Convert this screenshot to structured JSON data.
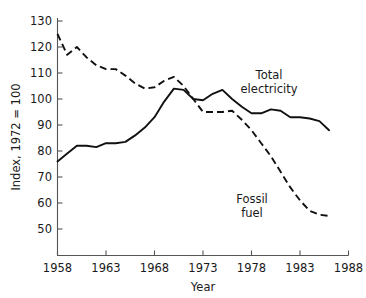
{
  "chart_data": {
    "type": "line",
    "title": "",
    "xlabel": "Year",
    "ylabel": "Index, 1972 = 100",
    "xlim": [
      1958,
      1988
    ],
    "ylim": [
      45,
      130
    ],
    "xticks": [
      "1958",
      "1963",
      "1968",
      "1973",
      "1978",
      "1983",
      "1988"
    ],
    "yticks": [
      "50",
      "60",
      "70",
      "80",
      "90",
      "100",
      "110",
      "120",
      "130"
    ],
    "grid": false,
    "legend_position": "inline-annotations",
    "series": [
      {
        "name": "Total electricity",
        "style": "solid",
        "label_text_line1": "Total",
        "label_text_line2": "electricity",
        "x": [
          1958,
          1959,
          1960,
          1961,
          1962,
          1963,
          1964,
          1965,
          1966,
          1967,
          1968,
          1969,
          1970,
          1971,
          1972,
          1973,
          1974,
          1975,
          1976,
          1977,
          1978,
          1979,
          1980,
          1981,
          1982,
          1983,
          1984,
          1985,
          1986
        ],
        "values": [
          76,
          79,
          82,
          82,
          81.5,
          83,
          83,
          83.5,
          86,
          89,
          93,
          99,
          104,
          103.5,
          100,
          99.5,
          102,
          103.5,
          100,
          97,
          94.5,
          94.5,
          96,
          95.5,
          93,
          93,
          92.5,
          91.5,
          88
        ]
      },
      {
        "name": "Fossil fuel",
        "style": "dashed",
        "label_text_line1": "Fossil",
        "label_text_line2": "fuel",
        "x": [
          1958,
          1959,
          1960,
          1961,
          1962,
          1963,
          1964,
          1965,
          1966,
          1967,
          1968,
          1969,
          1970,
          1971,
          1972,
          1973,
          1974,
          1975,
          1976,
          1977,
          1978,
          1979,
          1980,
          1981,
          1982,
          1983,
          1984,
          1985,
          1986
        ],
        "values": [
          125,
          117,
          120,
          116,
          113,
          111.5,
          111.5,
          109,
          106,
          104,
          104.5,
          107,
          108.5,
          105,
          100,
          95,
          95,
          95,
          95.5,
          92,
          88,
          83,
          78,
          72,
          66,
          61,
          57,
          55.5,
          55
        ]
      }
    ]
  },
  "axes": {
    "y_axis_title": "Index, 1972 = 100",
    "x_axis_title": "Year"
  },
  "annotations": {
    "total_electricity": {
      "line1": "Total",
      "line2": "electricity"
    },
    "fossil_fuel": {
      "line1": "Fossil",
      "line2": "fuel"
    }
  },
  "colors": {
    "background": "#ffffff",
    "line": "#111111",
    "axis": "#555555",
    "text": "#1a1a1a"
  }
}
